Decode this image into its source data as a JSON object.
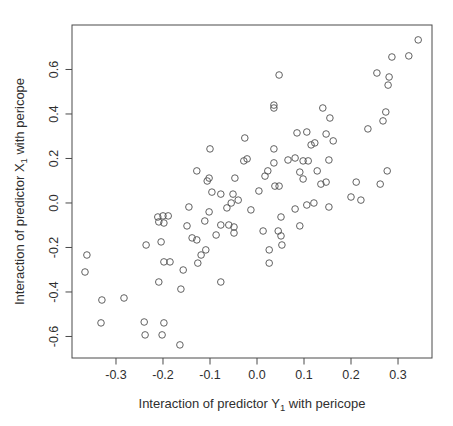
{
  "figure": {
    "background": "#ffffff",
    "axis_color": "#4a4a4a",
    "text_color": "#2f2f2f",
    "point_color": "#4f4f4f"
  },
  "chart_data": {
    "type": "scatter",
    "title": "",
    "xlabel_parts": {
      "prefix": "Interaction of predictor ",
      "var": "Y",
      "sub": "1",
      "suffix": " with pericope"
    },
    "ylabel_parts": {
      "prefix": "Interaction of predictor ",
      "var": "X",
      "sub": "1",
      "suffix": " with pericope"
    },
    "xlabel_plain": "Interaction of predictor Y1 with pericope",
    "ylabel_plain": "Interaction of predictor X1 with pericope",
    "xlim": [
      -0.3936,
      0.3723
    ],
    "ylim": [
      -0.6967,
      0.7999
    ],
    "x_ticks": [
      -0.3,
      -0.2,
      -0.1,
      0.0,
      0.1,
      0.2,
      0.3
    ],
    "y_ticks": [
      -0.6,
      -0.4,
      -0.2,
      0.0,
      0.2,
      0.4,
      0.6
    ],
    "grid": false,
    "legend": null,
    "marker": "open-circle",
    "points": [
      [
        -0.026,
        0.292
      ],
      [
        -0.1,
        0.243
      ],
      [
        -0.028,
        0.189
      ],
      [
        -0.021,
        0.198
      ],
      [
        -0.128,
        0.144
      ],
      [
        -0.102,
        0.112
      ],
      [
        -0.106,
        0.099
      ],
      [
        -0.047,
        0.112
      ],
      [
        -0.096,
        0.049
      ],
      [
        -0.077,
        0.04
      ],
      [
        -0.051,
        0.04
      ],
      [
        -0.04,
        0.013
      ],
      [
        0.343,
        0.733
      ],
      [
        0.287,
        0.656
      ],
      [
        0.323,
        0.661
      ],
      [
        0.047,
        0.575
      ],
      [
        0.255,
        0.584
      ],
      [
        0.281,
        0.566
      ],
      [
        0.279,
        0.53
      ],
      [
        0.036,
        0.44
      ],
      [
        0.036,
        0.427
      ],
      [
        0.14,
        0.427
      ],
      [
        0.274,
        0.409
      ],
      [
        0.155,
        0.382
      ],
      [
        0.268,
        0.369
      ],
      [
        0.236,
        0.333
      ],
      [
        0.085,
        0.315
      ],
      [
        0.106,
        0.319
      ],
      [
        0.147,
        0.31
      ],
      [
        0.162,
        0.279
      ],
      [
        0.115,
        0.261
      ],
      [
        0.123,
        0.27
      ],
      [
        0.036,
        0.243
      ],
      [
        0.066,
        0.193
      ],
      [
        0.081,
        0.202
      ],
      [
        0.098,
        0.189
      ],
      [
        0.109,
        0.189
      ],
      [
        0.036,
        0.18
      ],
      [
        0.023,
        0.144
      ],
      [
        0.017,
        0.121
      ],
      [
        0.091,
        0.139
      ],
      [
        0.098,
        0.108
      ],
      [
        0.128,
        0.144
      ],
      [
        0.153,
        0.193
      ],
      [
        0.277,
        0.144
      ],
      [
        0.211,
        0.094
      ],
      [
        0.262,
        0.085
      ],
      [
        0.136,
        0.085
      ],
      [
        0.147,
        0.094
      ],
      [
        0.038,
        0.076
      ],
      [
        0.047,
        0.076
      ],
      [
        0.004,
        0.054
      ],
      [
        0.2,
        0.027
      ],
      [
        0.221,
        0.013
      ],
      [
        -0.145,
        -0.018
      ],
      [
        -0.064,
        -0.022
      ],
      [
        -0.055,
        0.0
      ],
      [
        -0.102,
        -0.04
      ],
      [
        -0.111,
        -0.081
      ],
      [
        0.106,
        -0.009
      ],
      [
        0.121,
        0.0
      ],
      [
        0.153,
        -0.018
      ],
      [
        0.081,
        -0.027
      ],
      [
        -0.013,
        -0.031
      ],
      [
        -0.211,
        -0.063
      ],
      [
        -0.2,
        -0.058
      ],
      [
        -0.189,
        -0.058
      ],
      [
        -0.209,
        -0.085
      ],
      [
        -0.198,
        -0.09
      ],
      [
        -0.149,
        -0.103
      ],
      [
        0.051,
        -0.063
      ],
      [
        -0.077,
        -0.099
      ],
      [
        -0.06,
        -0.099
      ],
      [
        -0.049,
        -0.108
      ],
      [
        0.013,
        -0.126
      ],
      [
        0.045,
        -0.126
      ],
      [
        -0.087,
        -0.144
      ],
      [
        -0.049,
        -0.135
      ],
      [
        0.091,
        -0.103
      ],
      [
        -0.138,
        -0.157
      ],
      [
        -0.128,
        -0.166
      ],
      [
        0.051,
        -0.148
      ],
      [
        -0.236,
        -0.189
      ],
      [
        -0.204,
        -0.175
      ],
      [
        0.026,
        -0.211
      ],
      [
        0.053,
        -0.189
      ],
      [
        -0.109,
        -0.211
      ],
      [
        -0.119,
        -0.234
      ],
      [
        -0.126,
        -0.27
      ],
      [
        -0.362,
        -0.234
      ],
      [
        -0.366,
        -0.31
      ],
      [
        -0.198,
        -0.265
      ],
      [
        -0.185,
        -0.265
      ],
      [
        -0.157,
        -0.301
      ],
      [
        0.026,
        -0.27
      ],
      [
        -0.209,
        -0.355
      ],
      [
        -0.162,
        -0.387
      ],
      [
        -0.077,
        -0.355
      ],
      [
        -0.33,
        -0.436
      ],
      [
        -0.283,
        -0.427
      ],
      [
        -0.332,
        -0.539
      ],
      [
        -0.24,
        -0.535
      ],
      [
        -0.238,
        -0.593
      ],
      [
        -0.198,
        -0.539
      ],
      [
        -0.202,
        -0.593
      ],
      [
        -0.164,
        -0.638
      ]
    ]
  }
}
